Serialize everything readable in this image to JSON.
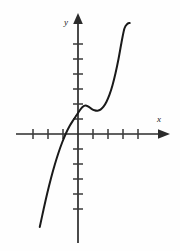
{
  "chart_data": {
    "type": "line",
    "title": "",
    "subtitle": "",
    "xlabel": "x",
    "ylabel": "y",
    "grid": false,
    "legend": false,
    "legend_position": "none",
    "axis_style": "arrow-terminated cartesian axes with tick marks, no numeric tick labels",
    "origin_px": {
      "x": 78,
      "y": 134
    },
    "tick_spacing_px": 15,
    "xlim": [
      -4.4,
      5.0
    ],
    "ylim": [
      -6.2,
      7.4
    ],
    "x_ticks_negative_count": 3,
    "x_ticks_positive_count": 4,
    "y_ticks_positive_count": 6,
    "y_ticks_negative_count": 5,
    "x_tick_values": [
      -3,
      -2,
      -1,
      1,
      2,
      3,
      4
    ],
    "y_tick_values": [
      1,
      2,
      3,
      4,
      5,
      6,
      -1,
      -2,
      -3,
      -4,
      -5
    ],
    "tick_labels_shown": false,
    "series": [
      {
        "name": "cubic",
        "x": [
          -2.55,
          -2.3,
          -2.05,
          -1.8,
          -1.55,
          -1.3,
          -1.05,
          -0.8,
          -0.55,
          -0.3,
          -0.1,
          0.1,
          0.3,
          0.5,
          0.7,
          0.9,
          1.1,
          1.3,
          1.5,
          1.7,
          1.9,
          2.1,
          2.3,
          2.5,
          2.7,
          2.9,
          3.1,
          3.3,
          3.45
        ],
        "y": [
          -6.2,
          -5.05,
          -3.95,
          -2.95,
          -2.05,
          -1.25,
          -0.55,
          0.05,
          0.55,
          0.95,
          1.25,
          1.55,
          1.8,
          1.9,
          1.82,
          1.68,
          1.58,
          1.55,
          1.62,
          1.82,
          2.15,
          2.62,
          3.25,
          4.05,
          5.0,
          6.1,
          7.05,
          7.35,
          7.4
        ]
      }
    ],
    "features": {
      "x_intercept": [
        -0.85,
        0
      ],
      "y_intercept": [
        0,
        1.4
      ],
      "local_maximum": [
        0.5,
        1.9
      ],
      "local_minimum": [
        1.3,
        1.55
      ]
    },
    "colors": {
      "curve": "#1a1a1a",
      "axis": "#2b2b2b",
      "tick": "#3a3a3a",
      "background": "#fefefe"
    },
    "curve_width_px": 2.0,
    "axis_width_px": 1.6
  },
  "labels": {
    "x_axis": "x",
    "y_axis": "y"
  }
}
